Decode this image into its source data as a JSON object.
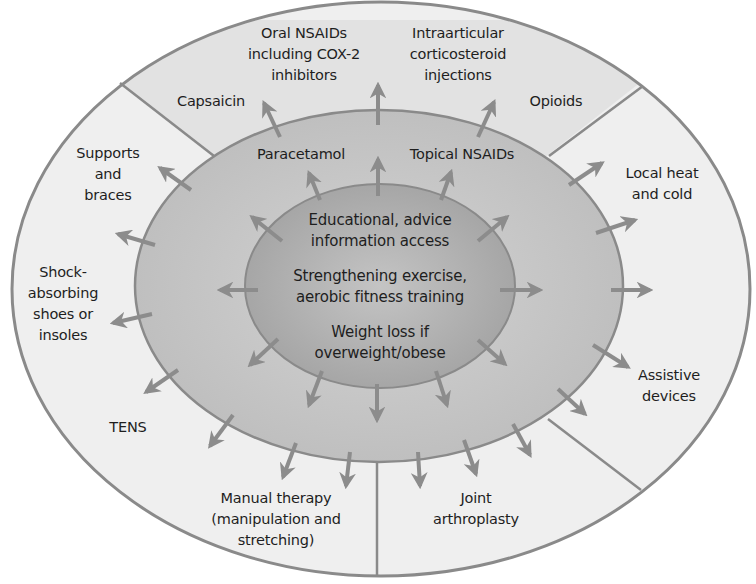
{
  "diagram": {
    "title": "",
    "colors": {
      "background": "#ffffff",
      "outer_ring": "#efefef",
      "outer_pharma_segment": "#e2e2e2",
      "middle_ring": "#c6c6c6",
      "inner_core": "#a9a9a9",
      "outline": "#8a8a8a",
      "arrow": "#8c8c8c",
      "text": "#1e1e1e"
    },
    "core": {
      "items": [
        {
          "text": "Educational, advice\ninformation access"
        },
        {
          "text": "Strengthening exercise,\naerobic fitness training"
        },
        {
          "text": "Weight loss if\noverweight/obese"
        }
      ]
    },
    "middle_ring": {
      "items": [
        {
          "text": "Paracetamol"
        },
        {
          "text": "Topical NSAIDs"
        }
      ]
    },
    "outer_ring": {
      "pharmacological_segment": [
        {
          "text": "Capsaicin"
        },
        {
          "text": "Oral NSAIDs\nincluding COX-2\ninhibitors"
        },
        {
          "text": "Intraarticular\ncorticosteroid\ninjections"
        },
        {
          "text": "Opioids"
        }
      ],
      "other_items": [
        {
          "text": "Supports\nand\nbraces"
        },
        {
          "text": "Shock-\nabsorbing\nshoes or\ninsoles"
        },
        {
          "text": "TENS"
        },
        {
          "text": "Manual therapy\n(manipulation and\nstretching)"
        },
        {
          "text": "Joint\narthroplasty"
        },
        {
          "text": "Assistive\ndevices"
        },
        {
          "text": "Local heat\nand cold"
        }
      ]
    }
  }
}
